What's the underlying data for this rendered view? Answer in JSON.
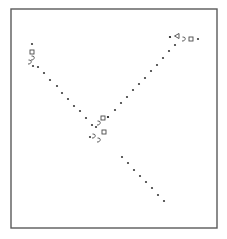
{
  "chart_data": {
    "type": "scatter",
    "title": "",
    "xlabel": "",
    "ylabel": "",
    "grid": false,
    "legend": null,
    "frame": {
      "x": 11,
      "y": 9,
      "width": 206,
      "height": 219,
      "color": "#5a5a5a"
    },
    "point_color": "#3a3a3a",
    "note": "Coordinates are pixel positions within the 227x239 image; the plot has no visible axis ticks or labels.",
    "series": [
      {
        "name": "upper-left-branch",
        "points": [
          [
            32,
            44
          ],
          [
            33,
            66
          ],
          [
            38,
            67
          ],
          [
            44,
            73
          ],
          [
            50,
            80
          ],
          [
            57,
            86
          ],
          [
            62,
            93
          ],
          [
            68,
            99
          ],
          [
            74,
            106
          ],
          [
            80,
            111
          ],
          [
            86,
            118
          ],
          [
            92,
            125
          ]
        ]
      },
      {
        "name": "upper-right-branch",
        "points": [
          [
            108,
            117
          ],
          [
            115,
            110
          ],
          [
            121,
            103
          ],
          [
            127,
            97
          ],
          [
            133,
            90
          ],
          [
            139,
            84
          ],
          [
            145,
            78
          ],
          [
            151,
            71
          ],
          [
            157,
            65
          ],
          [
            163,
            58
          ],
          [
            169,
            51
          ],
          [
            175,
            45
          ],
          [
            170,
            37
          ]
        ]
      },
      {
        "name": "lower-branch",
        "points": [
          [
            122,
            157
          ],
          [
            128,
            163
          ],
          [
            134,
            170
          ],
          [
            140,
            176
          ],
          [
            146,
            182
          ],
          [
            152,
            188
          ],
          [
            158,
            195
          ],
          [
            164,
            201
          ]
        ]
      },
      {
        "name": "upper-left-cluster",
        "glyphs": [
          {
            "x": 32,
            "y": 52,
            "shape": "square"
          },
          {
            "x": 33,
            "y": 58,
            "shape": "hook"
          },
          {
            "x": 30,
            "y": 62,
            "shape": "hook"
          }
        ]
      },
      {
        "name": "upper-right-cluster",
        "points": [
          [
            170,
            37
          ],
          [
            198,
            39
          ]
        ],
        "glyphs": [
          {
            "x": 177,
            "y": 36,
            "shape": "triangle"
          },
          {
            "x": 184,
            "y": 39,
            "shape": "hook"
          },
          {
            "x": 191,
            "y": 39,
            "shape": "square"
          }
        ]
      },
      {
        "name": "center-cluster",
        "points": [
          [
            96,
            127
          ],
          [
            90,
            137
          ],
          [
            108,
            117
          ]
        ],
        "glyphs": [
          {
            "x": 103,
            "y": 118,
            "shape": "square"
          },
          {
            "x": 99,
            "y": 123,
            "shape": "hook"
          },
          {
            "x": 104,
            "y": 132,
            "shape": "square"
          },
          {
            "x": 99,
            "y": 140,
            "shape": "hook"
          },
          {
            "x": 94,
            "y": 136,
            "shape": "hook"
          }
        ]
      }
    ]
  }
}
